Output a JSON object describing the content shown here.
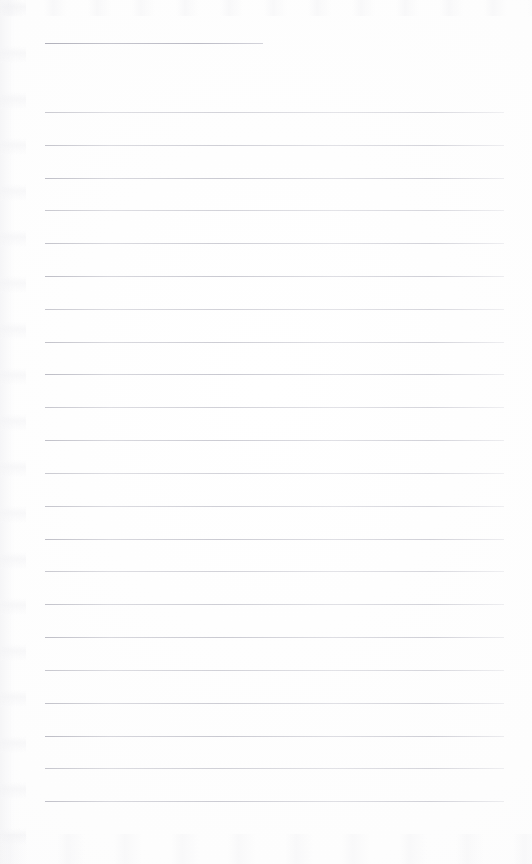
{
  "document": {
    "kind": "scanned-lined-paper",
    "title": "",
    "body_text": "",
    "visible_text": "",
    "page_width_px": 532,
    "page_height_px": 864,
    "background_color": "#fefefe",
    "rule_color": "#b4b4be",
    "notes_text": ""
  },
  "rules": {
    "heading_rule": {
      "label": "",
      "y": 43,
      "x_start": 45,
      "x_end": 263,
      "thickness_px": 1
    },
    "body_rule_geometry": {
      "first_y": 112,
      "spacing_px": 32.8,
      "count": 22,
      "x_start": 45,
      "x_end": 504,
      "thickness_px": 1
    },
    "body_rule_y_positions": [
      112,
      145,
      178,
      210,
      243,
      276,
      309,
      342,
      374,
      407,
      440,
      473,
      506,
      539,
      571,
      604,
      637,
      670,
      703,
      736,
      768,
      801
    ]
  },
  "margins": {
    "left_px": 45,
    "right_px": 28,
    "top_px": 43,
    "bottom_px": 63
  }
}
